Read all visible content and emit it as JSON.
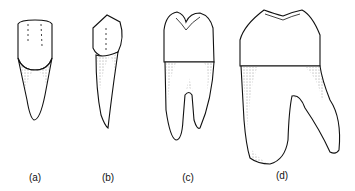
{
  "figure": {
    "teeth": [
      {
        "id": "a",
        "label": "(a)",
        "type": "incisor"
      },
      {
        "id": "b",
        "label": "(b)",
        "type": "canine"
      },
      {
        "id": "c",
        "label": "(c)",
        "type": "premolar"
      },
      {
        "id": "d",
        "label": "(d)",
        "type": "molar"
      }
    ]
  }
}
